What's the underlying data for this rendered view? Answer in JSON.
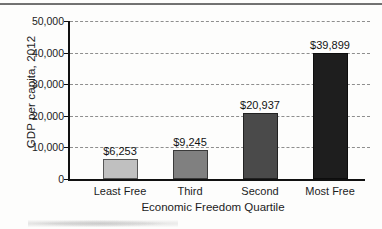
{
  "chart_data": {
    "type": "bar",
    "title": "",
    "xlabel": "Economic Freedom Quartile",
    "ylabel": "GDP per capita, 2012",
    "categories": [
      "Least Free",
      "Third",
      "Second",
      "Most Free"
    ],
    "values": [
      6253,
      9245,
      20937,
      39899
    ],
    "value_labels": [
      "$6,253",
      "$9,245",
      "$20,937",
      "$39,899"
    ],
    "bar_colors": [
      "#c0c0c0",
      "#808080",
      "#4a4a4a",
      "#1e1e1e"
    ],
    "ylim": [
      0,
      50000
    ],
    "ytick_values": [
      0,
      10000,
      20000,
      30000,
      40000,
      50000
    ],
    "ytick_labels": [
      "0",
      "10,000",
      "20,000",
      "30,000",
      "40,000",
      "50,000"
    ],
    "grid": "horizontal-dashed",
    "legend": "none"
  }
}
